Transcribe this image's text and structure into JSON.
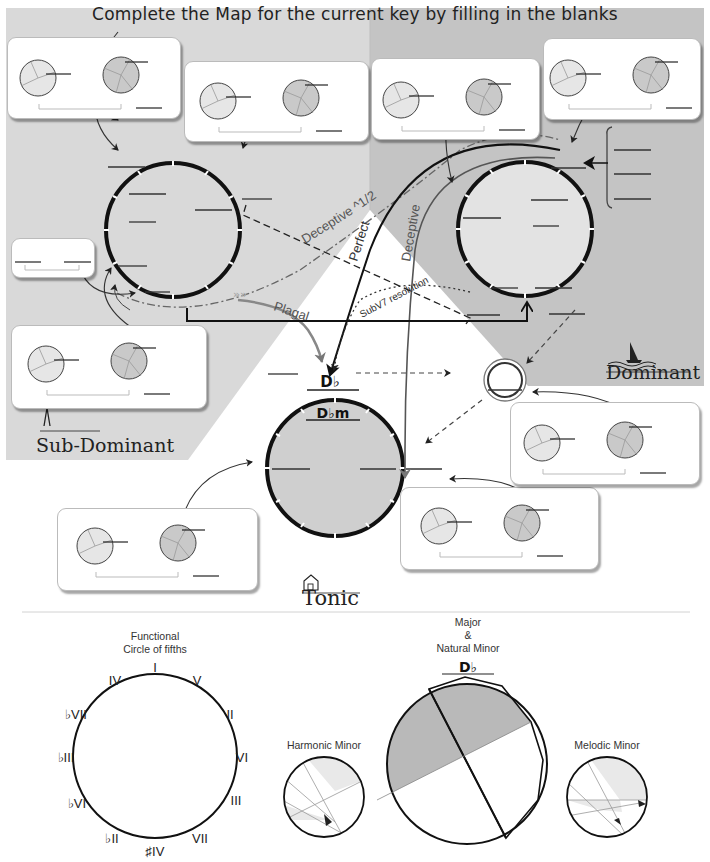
{
  "header": {
    "title": "Complete the Map for the current  key by filling in the blanks"
  },
  "regions": {
    "sub_dominant": {
      "label": "Sub-Dominant",
      "icon": "compass-icon",
      "fill": "#d9d9d9"
    },
    "dominant": {
      "label": "Dominant",
      "icon": "sailboat-icon",
      "fill": "#c4c4c4"
    },
    "tonic": {
      "label": "Tonic",
      "icon": "house-icon",
      "fill": "#ffffff"
    }
  },
  "cadence_labels": {
    "deceptive_half": "Deceptive ^1/2",
    "deceptive": "Deceptive",
    "perfect": "Perfect",
    "plagal": "Plagal",
    "subv7_resolution": "SubV7 resolution"
  },
  "tonic_circle": {
    "chord_major": "D♭",
    "chord_minor": "D♭m",
    "fill": "#cfcfcf"
  },
  "chord_cards": [
    {
      "id": "sd-top-left",
      "blanks": 3
    },
    {
      "id": "sd-top-mid",
      "blanks": 3
    },
    {
      "id": "dom-top-mid",
      "blanks": 3
    },
    {
      "id": "dom-top-right",
      "blanks": 3
    },
    {
      "id": "sd-small",
      "blanks": 2
    },
    {
      "id": "sd-bottom",
      "blanks": 3
    },
    {
      "id": "tonic-left",
      "blanks": 3
    },
    {
      "id": "tonic-right",
      "blanks": 3
    },
    {
      "id": "dom-right",
      "blanks": 3
    }
  ],
  "legend": {
    "functional_circle": {
      "title_line1": "Functional",
      "title_line2": "Circle of fifths",
      "labels": [
        "I",
        "V",
        "II",
        "VI",
        "III",
        "VII",
        "♯IV",
        "♭II",
        "♭VI",
        "♭III",
        "♭VII",
        "IV"
      ]
    },
    "harmonic_minor": {
      "title": "Harmonic Minor"
    },
    "major_natural_minor": {
      "title_line1": "Major",
      "title_line2": "&",
      "title_line3": "Natural Minor",
      "key": "D♭"
    },
    "melodic_minor": {
      "title": "Melodic Minor"
    }
  },
  "colors": {
    "light_gray": "#d9d9d9",
    "dark_gray": "#c4c4c4",
    "line": "#111111",
    "card_border": "#bbbbbb"
  }
}
